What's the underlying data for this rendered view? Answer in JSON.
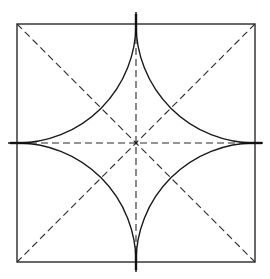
{
  "diagram": {
    "title": "",
    "canvas": {
      "width": 270,
      "height": 279
    },
    "square": {
      "x1": 17,
      "y1": 24,
      "x2": 255,
      "y2": 262
    },
    "center": {
      "x": 136,
      "y": 143
    },
    "axes": {
      "horizontal": {
        "x1": 8,
        "x2": 263,
        "y": 143
      },
      "vertical": {
        "x": 136,
        "y1": 12,
        "y2": 272
      }
    },
    "colors": {
      "line": "#1a1a1a",
      "background": "#ffffff"
    },
    "labels": []
  }
}
